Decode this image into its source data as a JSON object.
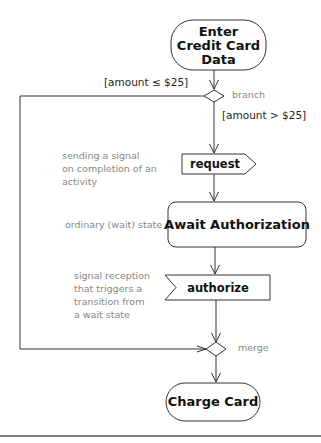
{
  "diagram": {
    "type": "UML activity diagram",
    "nodes": {
      "start_action": {
        "lines": [
          "Enter",
          "Credit Card",
          "Data"
        ]
      },
      "branch": {
        "label": "branch"
      },
      "request": {
        "label": "request",
        "kind": "signal-send"
      },
      "await": {
        "label": "Await Authorization",
        "kind": "wait-state"
      },
      "authorize": {
        "label": "authorize",
        "kind": "signal-receive"
      },
      "merge": {
        "label": "merge"
      },
      "charge": {
        "label": "Charge Card"
      }
    },
    "guards": {
      "low": "[amount ≤ $25]",
      "high": "[amount > $25]"
    },
    "notes": {
      "send": [
        "sending a signal",
        "on completion of an",
        "activity"
      ],
      "wait": "ordinary (wait) state",
      "receive": [
        "signal reception",
        "that triggers a",
        "transition from",
        "a wait state"
      ]
    },
    "colors": {
      "stroke": "#333333",
      "node_text": "#111111",
      "note_text": "#888888"
    }
  }
}
